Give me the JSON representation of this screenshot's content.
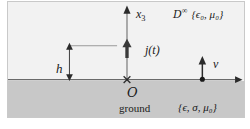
{
  "figure": {
    "colors": {
      "upper_halfspace_fill": "#f2f2f2",
      "ground_fill": "#c8c8c8",
      "line": "#555555",
      "text": "#1a1a1a",
      "border": "#c9c9c9"
    },
    "axes": {
      "vertical_axis_label": "x",
      "vertical_axis_label_sub": "3",
      "horizontal_axis_label": ""
    },
    "labels": {
      "upper_domain_symbol": "D",
      "upper_domain_superscript": "∞",
      "upper_domain_constants": "{ϵ₀, μ₀}",
      "source_current": "j(t)",
      "height_symbol": "h",
      "normal_vector": "ν",
      "origin": "O",
      "ground_label": "ground",
      "ground_constants": "{ϵ, σ, μ₀}"
    }
  }
}
